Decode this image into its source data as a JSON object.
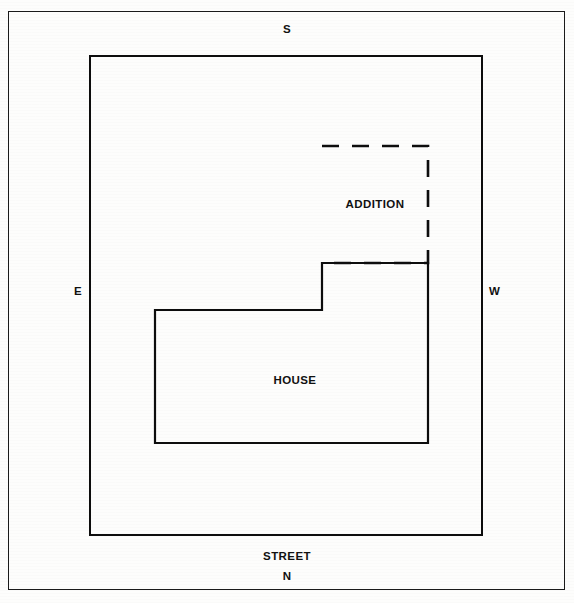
{
  "figure": {
    "kind": "site-plan-diagram",
    "title_caption": "",
    "background_color": "#fdfdfc",
    "line_color": "#0d0d0d"
  },
  "compass": {
    "south_label": "S",
    "north_label": "N",
    "east_label": "E",
    "west_label": "W"
  },
  "street": {
    "label": "STREET"
  },
  "structures": {
    "house": {
      "label": "HOUSE",
      "style": "solid-outline"
    },
    "addition": {
      "label": "ADDITION",
      "style": "dashed-outline"
    },
    "lot": {
      "label": "",
      "style": "solid-outline"
    }
  },
  "chart_data": {
    "type": "diagram",
    "title": "",
    "outer_frame": {
      "x": 8,
      "y": 11,
      "width": 557,
      "height": 579
    },
    "lot_boundary": {
      "x": 89,
      "y": 55,
      "width": 394,
      "height": 481
    },
    "house_outline_points": "155,310 322,310 322,263 428,263 428,443 155,443 155,310",
    "addition_outline_points": "322,146 428,146 428,263 322,263",
    "labels": [
      {
        "text": "S",
        "x": 287,
        "y": 30
      },
      {
        "text": "E",
        "x": 78,
        "y": 292
      },
      {
        "text": "W",
        "x": 494,
        "y": 292
      },
      {
        "text": "STREET",
        "x": 287,
        "y": 557
      },
      {
        "text": "N",
        "x": 287,
        "y": 577
      },
      {
        "text": "HOUSE",
        "x": 292,
        "y": 381
      },
      {
        "text": "ADDITION",
        "x": 375,
        "y": 205
      }
    ],
    "grid": false,
    "legend": "none"
  }
}
